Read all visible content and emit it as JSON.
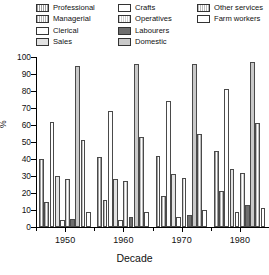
{
  "chart_data": {
    "type": "bar",
    "title": "",
    "xlabel": "Decade",
    "ylabel": "%",
    "ylim": [
      0,
      100
    ],
    "yticks": [
      0,
      10,
      20,
      30,
      40,
      50,
      60,
      70,
      80,
      90,
      100
    ],
    "grid": false,
    "legend_position": "top",
    "categories": [
      "1950",
      "1960",
      "1970",
      "1980"
    ],
    "series": [
      {
        "name": "Professional",
        "color": "#9d9d9d",
        "pattern": "hatch",
        "values": [
          40,
          41,
          42,
          45
        ]
      },
      {
        "name": "Managerial",
        "color": "#b4b4b4",
        "pattern": "hatch",
        "values": [
          15,
          16,
          18,
          21
        ]
      },
      {
        "name": "Clerical",
        "color": "#fdfdfd",
        "pattern": "plain",
        "values": [
          62,
          68,
          74,
          81
        ]
      },
      {
        "name": "Sales",
        "color": "#e2e2e2",
        "pattern": "plain",
        "values": [
          30,
          28,
          31,
          34
        ]
      },
      {
        "name": "Crafts",
        "color": "#ffffff",
        "pattern": "plain",
        "values": [
          4,
          4,
          6,
          9
        ]
      },
      {
        "name": "Operatives",
        "color": "#cfcfcf",
        "pattern": "hatch",
        "values": [
          28,
          27,
          29,
          32
        ]
      },
      {
        "name": "Labourers",
        "color": "#6e6e6e",
        "pattern": "solid",
        "values": [
          5,
          6,
          7,
          13
        ]
      },
      {
        "name": "Domestic",
        "color": "#c9c9c9",
        "pattern": "plain",
        "values": [
          95,
          96,
          96,
          97
        ]
      },
      {
        "name": "Other services",
        "color": "#bdbdbd",
        "pattern": "hatch",
        "values": [
          51,
          53,
          55,
          61
        ]
      },
      {
        "name": "Farm workers",
        "color": "#ffffff",
        "pattern": "plain",
        "values": [
          9,
          9,
          10,
          11
        ]
      }
    ]
  },
  "legend": {
    "columns": [
      [
        "Professional",
        "Managerial",
        "Clerical",
        "Sales"
      ],
      [
        "Crafts",
        "Operatives",
        "Labourers",
        "Domestic"
      ],
      [
        "Other services",
        "Farm workers"
      ]
    ]
  }
}
